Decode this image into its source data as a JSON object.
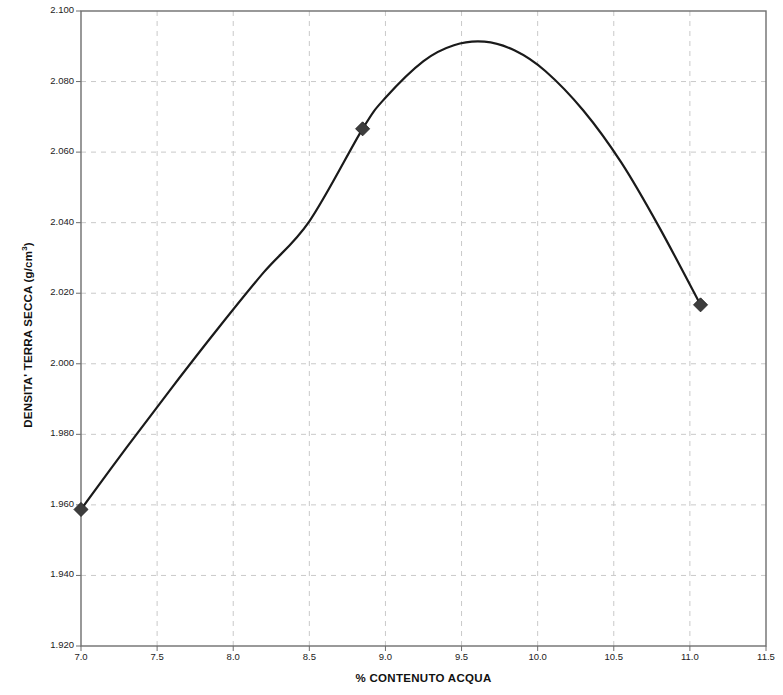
{
  "chart_data": {
    "type": "line",
    "title": "",
    "subtitle": "",
    "xlabel": "% CONTENUTO ACQUA",
    "ylabel": "DENSITA' TERRA SECCA (g/cm3)",
    "ylabel_main": "DENSITA' TERRA SECCA (g/cm",
    "ylabel_sup": "3",
    "ylabel_tail": ")",
    "xlim": [
      7.0,
      11.5
    ],
    "ylim": [
      1.92,
      2.1
    ],
    "grid": true,
    "grid_style": "dashed",
    "legend": "none",
    "x_ticks": [
      7.0,
      7.5,
      8.0,
      8.5,
      9.0,
      9.5,
      10.0,
      10.5,
      11.0,
      11.5
    ],
    "x_tick_labels": [
      "7.0",
      "7.5",
      "8.0",
      "8.5",
      "9.0",
      "9.5",
      "10.0",
      "10.5",
      "11.0",
      "11.5"
    ],
    "y_ticks": [
      1.92,
      1.94,
      1.96,
      1.98,
      2.0,
      2.02,
      2.04,
      2.06,
      2.08,
      2.1
    ],
    "y_tick_labels": [
      "1.920",
      "1.940",
      "1.960",
      "1.980",
      "2.000",
      "2.020",
      "2.040",
      "2.060",
      "2.080",
      "2.100"
    ],
    "series": [
      {
        "name": "Proctor curve",
        "type": "line",
        "line_color": "#1a1a1a",
        "line_width": 2.2,
        "marker": "diamond",
        "marker_color": "#3d3d3d",
        "points": [
          {
            "x": 7.0,
            "y": 1.9587
          },
          {
            "x": 8.85,
            "y": 2.0666
          },
          {
            "x": 11.07,
            "y": 2.0167
          }
        ],
        "curve_points": [
          {
            "x": 7.0,
            "y": 1.9587
          },
          {
            "x": 7.3,
            "y": 1.9763
          },
          {
            "x": 7.6,
            "y": 1.9934
          },
          {
            "x": 7.9,
            "y": 2.01
          },
          {
            "x": 8.2,
            "y": 2.0259
          },
          {
            "x": 8.5,
            "y": 2.0404
          },
          {
            "x": 8.85,
            "y": 2.0666
          },
          {
            "x": 9.0,
            "y": 2.0754
          },
          {
            "x": 9.25,
            "y": 2.0858
          },
          {
            "x": 9.45,
            "y": 2.0903
          },
          {
            "x": 9.65,
            "y": 2.0913
          },
          {
            "x": 9.85,
            "y": 2.0888
          },
          {
            "x": 10.05,
            "y": 2.083
          },
          {
            "x": 10.3,
            "y": 2.0718
          },
          {
            "x": 10.55,
            "y": 2.057
          },
          {
            "x": 10.8,
            "y": 2.0386
          },
          {
            "x": 11.07,
            "y": 2.0167
          }
        ],
        "peak": {
          "x": 9.65,
          "y": 2.0913
        }
      }
    ],
    "axis_color": "#6e6e6e",
    "grid_color": "#c9c9c9",
    "background": "#ffffff"
  }
}
